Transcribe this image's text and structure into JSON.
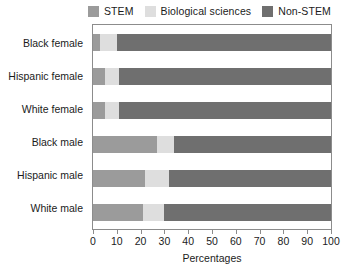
{
  "chart_data": {
    "type": "bar",
    "orientation": "horizontal",
    "stacked": true,
    "title": "",
    "xlabel": "Percentages",
    "ylabel": "",
    "xlim": [
      0,
      100
    ],
    "xticks": [
      0,
      10,
      20,
      30,
      40,
      50,
      60,
      70,
      80,
      90,
      100
    ],
    "grid": false,
    "legend_position": "top",
    "categories": [
      "Black female",
      "Hispanic female",
      "White female",
      "Black male",
      "Hispanic male",
      "White male"
    ],
    "series": [
      {
        "name": "STEM",
        "color": "#9b9b9b",
        "values": [
          3,
          5,
          5,
          27,
          22,
          21
        ]
      },
      {
        "name": "Biological sciences",
        "color": "#dedede",
        "values": [
          7,
          6,
          6,
          7,
          10,
          9
        ]
      },
      {
        "name": "Non-STEM",
        "color": "#6f6f6f",
        "values": [
          90,
          89,
          89,
          66,
          68,
          70
        ]
      }
    ]
  },
  "legend": {
    "items": [
      {
        "label": "STEM",
        "color": "#9b9b9b"
      },
      {
        "label": "Biological sciences",
        "color": "#dedede"
      },
      {
        "label": "Non-STEM",
        "color": "#6f6f6f"
      }
    ]
  },
  "axis": {
    "x_title": "Percentages",
    "tick_labels": [
      "0",
      "10",
      "20",
      "30",
      "40",
      "50",
      "60",
      "70",
      "80",
      "90",
      "100"
    ]
  }
}
